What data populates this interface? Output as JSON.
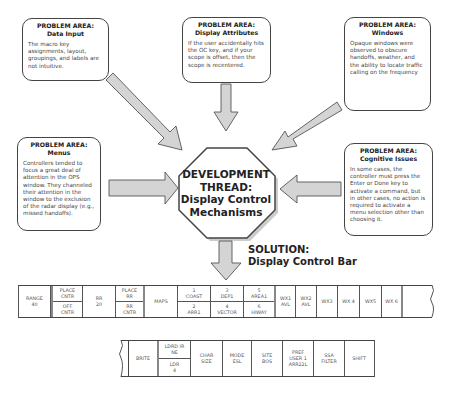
{
  "problem_areas": {
    "data_input": {
      "title_line1": "PROBLEM AREA:",
      "title_line2": "Data Input",
      "body": "The macro key assignments, layout, groupings, and labels are not intuitive."
    },
    "display_attributes": {
      "title_line1": "PROBLEM AREA:",
      "title_line2": "Display Attributes",
      "body": "If the user accidentally hits the OC key, and if your scope is offset, then the scope is recentered."
    },
    "windows": {
      "title_line1": "PROBLEM AREA:",
      "title_line2": "Windows",
      "body": "Opaque windows were observed to obscure handoffs, weather, and the ability to locate traffic calling on the frequency"
    },
    "menus": {
      "title_line1": "PROBLEM AREA:",
      "title_line2": "Menus",
      "body": "Controllers tended to focus a great deal of attention in the OPS window.  They channeled their attention in the window to the exclusion of the radar display (e.g., missed handoffs)."
    },
    "cognitive_issues": {
      "title_line1": "PROBLEM AREA:",
      "title_line2": "Cognitive Issues",
      "body": "In some cases, the controller must press the Enter or Done key to activate a command, but in other cases, no action is required to activate a menu selection other than choosing it."
    }
  },
  "development_thread": {
    "line1": "DEVELOPMENT",
    "line2": "THREAD:",
    "line3": "Display Control",
    "line4": "Mechanisms"
  },
  "solution": {
    "line1": "SOLUTION:",
    "line2": "Display Control Bar"
  },
  "control_bar_top": {
    "range": [
      "RANGE",
      "40"
    ],
    "place_cntr": [
      "PLACE",
      "CNTR"
    ],
    "off_cntr": [
      "OFF",
      "CNTR"
    ],
    "rr": [
      "RR",
      "20"
    ],
    "place_rr": [
      "PLACE",
      "RR"
    ],
    "rr_cntr": [
      "RR",
      "CNTR"
    ],
    "maps": "MAPS",
    "map1": [
      "1",
      "COAST"
    ],
    "map2": [
      "2",
      "ARR1"
    ],
    "map3": [
      "3",
      "DEP1"
    ],
    "map4": [
      "4",
      "VECTOR"
    ],
    "map5": [
      "5",
      "AREA1"
    ],
    "map6": [
      "6",
      "HIWAY"
    ],
    "wx1": [
      "WX1",
      "AVL"
    ],
    "wx2": [
      "WX2",
      "AVL"
    ],
    "wx3": "WX3",
    "wx4": "WX 4",
    "wx5": "WX5",
    "wx6": "WX 6"
  },
  "control_bar_bottom": {
    "brite": "BRITE",
    "ldrdir": [
      "LDRD IR",
      "NE"
    ],
    "ldr": [
      "LDR",
      "4"
    ],
    "char_size": [
      "CHAR",
      "SIZE"
    ],
    "mode": [
      "MODE",
      "ESL"
    ],
    "site": [
      "SITE",
      "BOS"
    ],
    "pref": [
      "PREF",
      "USER 1",
      "ARR22L"
    ],
    "ssa": [
      "SSA",
      "FILTER"
    ],
    "shift": "SHIFT"
  }
}
